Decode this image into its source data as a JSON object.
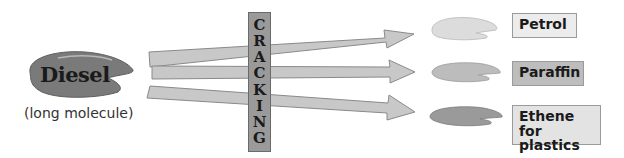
{
  "source": {
    "label": "Diesel",
    "description": "(long molecule)",
    "color": "#7a7a7a"
  },
  "process": {
    "letters": [
      "C",
      "R",
      "A",
      "C",
      "K",
      "I",
      "N",
      "G"
    ],
    "word": "CRACKING"
  },
  "products": [
    {
      "label": "Petrol",
      "blob_color": "#dcdcdc",
      "box_color": "#ececec"
    },
    {
      "label": "Paraffin",
      "blob_color": "#bcbcbc",
      "box_color": "#bdbdbd"
    },
    {
      "label_line1": "Ethene",
      "label_line2": "for plastics",
      "blob_color": "#9a9a9a",
      "box_color": "#e3e3e3"
    }
  ]
}
